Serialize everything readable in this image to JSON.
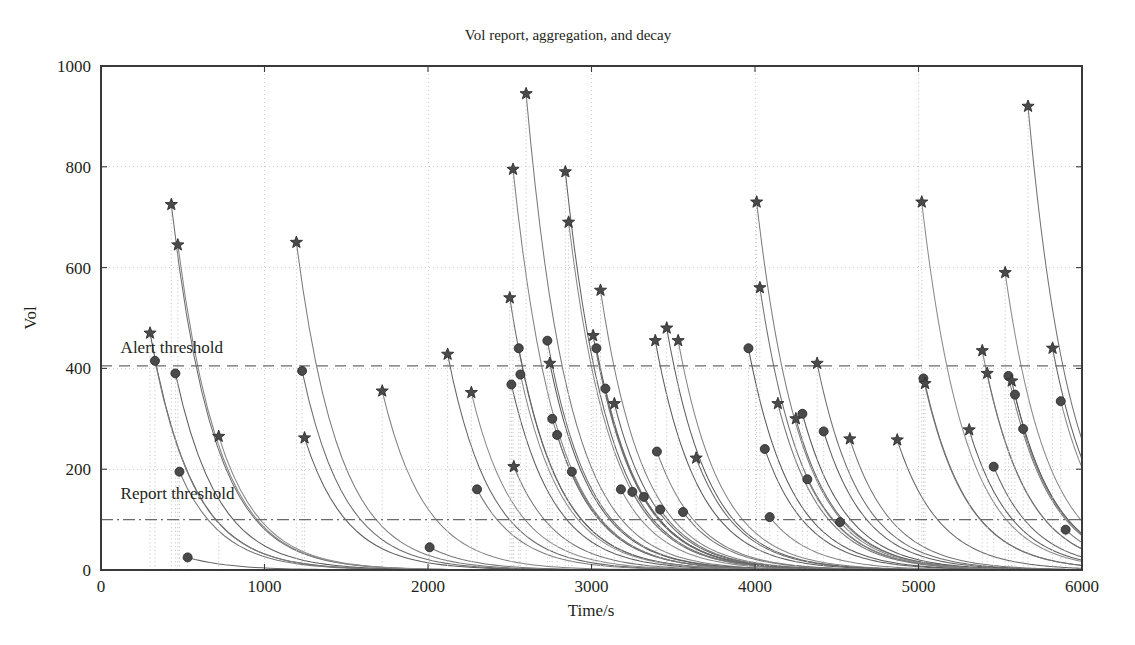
{
  "chart_data": {
    "type": "line",
    "title": "Vol report, aggregation, and decay",
    "xlabel": "Time/s",
    "ylabel": "Vol",
    "xlim": [
      0,
      6000
    ],
    "ylim": [
      0,
      1000
    ],
    "xticks": [
      0,
      1000,
      2000,
      3000,
      4000,
      5000,
      6000
    ],
    "yticks": [
      0,
      200,
      400,
      600,
      800,
      1000
    ],
    "xtick_labels": [
      "0",
      "1000",
      "2000",
      "3000",
      "4000",
      "5000",
      "6000"
    ],
    "ytick_labels": [
      "0",
      "200",
      "400",
      "600",
      "800",
      "1000"
    ],
    "grid": "dotted-light",
    "legend": "none",
    "annotations": [
      {
        "name": "alert-threshold",
        "label": "Alert threshold",
        "value": 405,
        "style": "dashed",
        "label_x": 120,
        "label_y": 430
      },
      {
        "name": "report-threshold",
        "label": "Report threshold",
        "value": 100,
        "style": "dashdot",
        "label_x": 120,
        "label_y": 140
      }
    ],
    "marker_star_label": "Alert event peak",
    "marker_circle_label": "Report event peak",
    "decay_tau": 260,
    "events": [
      {
        "t": 300,
        "peak": 470,
        "marker": "star"
      },
      {
        "t": 330,
        "peak": 415,
        "marker": "circle"
      },
      {
        "t": 430,
        "peak": 725,
        "marker": "star"
      },
      {
        "t": 455,
        "peak": 390,
        "marker": "circle"
      },
      {
        "t": 470,
        "peak": 645,
        "marker": "star"
      },
      {
        "t": 480,
        "peak": 195,
        "marker": "circle"
      },
      {
        "t": 530,
        "peak": 25,
        "marker": "circle"
      },
      {
        "t": 720,
        "peak": 265,
        "marker": "star"
      },
      {
        "t": 1195,
        "peak": 650,
        "marker": "star"
      },
      {
        "t": 1230,
        "peak": 395,
        "marker": "circle"
      },
      {
        "t": 1245,
        "peak": 262,
        "marker": "star"
      },
      {
        "t": 1720,
        "peak": 355,
        "marker": "star"
      },
      {
        "t": 2010,
        "peak": 45,
        "marker": "circle"
      },
      {
        "t": 2120,
        "peak": 428,
        "marker": "star"
      },
      {
        "t": 2265,
        "peak": 352,
        "marker": "star"
      },
      {
        "t": 2300,
        "peak": 160,
        "marker": "circle"
      },
      {
        "t": 2500,
        "peak": 540,
        "marker": "star"
      },
      {
        "t": 2510,
        "peak": 368,
        "marker": "circle"
      },
      {
        "t": 2520,
        "peak": 795,
        "marker": "star"
      },
      {
        "t": 2525,
        "peak": 205,
        "marker": "star"
      },
      {
        "t": 2555,
        "peak": 440,
        "marker": "circle"
      },
      {
        "t": 2565,
        "peak": 388,
        "marker": "circle"
      },
      {
        "t": 2600,
        "peak": 945,
        "marker": "star"
      },
      {
        "t": 2730,
        "peak": 455,
        "marker": "circle"
      },
      {
        "t": 2745,
        "peak": 410,
        "marker": "star"
      },
      {
        "t": 2760,
        "peak": 300,
        "marker": "circle"
      },
      {
        "t": 2790,
        "peak": 268,
        "marker": "circle"
      },
      {
        "t": 2840,
        "peak": 790,
        "marker": "star"
      },
      {
        "t": 2860,
        "peak": 690,
        "marker": "star"
      },
      {
        "t": 2880,
        "peak": 195,
        "marker": "circle"
      },
      {
        "t": 3010,
        "peak": 465,
        "marker": "star"
      },
      {
        "t": 3030,
        "peak": 440,
        "marker": "circle"
      },
      {
        "t": 3055,
        "peak": 555,
        "marker": "star"
      },
      {
        "t": 3085,
        "peak": 360,
        "marker": "circle"
      },
      {
        "t": 3140,
        "peak": 330,
        "marker": "star"
      },
      {
        "t": 3180,
        "peak": 160,
        "marker": "circle"
      },
      {
        "t": 3250,
        "peak": 155,
        "marker": "circle"
      },
      {
        "t": 3320,
        "peak": 145,
        "marker": "circle"
      },
      {
        "t": 3390,
        "peak": 455,
        "marker": "star"
      },
      {
        "t": 3400,
        "peak": 235,
        "marker": "circle"
      },
      {
        "t": 3420,
        "peak": 120,
        "marker": "circle"
      },
      {
        "t": 3460,
        "peak": 480,
        "marker": "star"
      },
      {
        "t": 3530,
        "peak": 455,
        "marker": "star"
      },
      {
        "t": 3560,
        "peak": 115,
        "marker": "circle"
      },
      {
        "t": 3640,
        "peak": 222,
        "marker": "star"
      },
      {
        "t": 3960,
        "peak": 440,
        "marker": "circle"
      },
      {
        "t": 4010,
        "peak": 730,
        "marker": "star"
      },
      {
        "t": 4030,
        "peak": 560,
        "marker": "star"
      },
      {
        "t": 4060,
        "peak": 240,
        "marker": "circle"
      },
      {
        "t": 4090,
        "peak": 105,
        "marker": "circle"
      },
      {
        "t": 4140,
        "peak": 330,
        "marker": "star"
      },
      {
        "t": 4250,
        "peak": 300,
        "marker": "star"
      },
      {
        "t": 4290,
        "peak": 310,
        "marker": "circle"
      },
      {
        "t": 4320,
        "peak": 180,
        "marker": "circle"
      },
      {
        "t": 4380,
        "peak": 410,
        "marker": "star"
      },
      {
        "t": 4420,
        "peak": 275,
        "marker": "circle"
      },
      {
        "t": 4520,
        "peak": 95,
        "marker": "circle"
      },
      {
        "t": 4580,
        "peak": 260,
        "marker": "star"
      },
      {
        "t": 4870,
        "peak": 258,
        "marker": "star"
      },
      {
        "t": 5020,
        "peak": 730,
        "marker": "star"
      },
      {
        "t": 5030,
        "peak": 380,
        "marker": "circle"
      },
      {
        "t": 5040,
        "peak": 370,
        "marker": "star"
      },
      {
        "t": 5310,
        "peak": 278,
        "marker": "star"
      },
      {
        "t": 5390,
        "peak": 435,
        "marker": "star"
      },
      {
        "t": 5420,
        "peak": 390,
        "marker": "star"
      },
      {
        "t": 5460,
        "peak": 205,
        "marker": "circle"
      },
      {
        "t": 5530,
        "peak": 590,
        "marker": "star"
      },
      {
        "t": 5550,
        "peak": 385,
        "marker": "circle"
      },
      {
        "t": 5570,
        "peak": 375,
        "marker": "star"
      },
      {
        "t": 5590,
        "peak": 348,
        "marker": "circle"
      },
      {
        "t": 5640,
        "peak": 280,
        "marker": "circle"
      },
      {
        "t": 5670,
        "peak": 920,
        "marker": "star"
      },
      {
        "t": 5820,
        "peak": 440,
        "marker": "star"
      },
      {
        "t": 5870,
        "peak": 335,
        "marker": "circle"
      },
      {
        "t": 5900,
        "peak": 80,
        "marker": "circle"
      }
    ]
  },
  "colors": {
    "curve": "#5a5a5a",
    "marker": "#4a4a4a",
    "axis": "#3a3a3a",
    "grid": "#c9c9c9",
    "threshold": "#6a6a6a",
    "background": "#ffffff",
    "text": "#231f20"
  },
  "plot_box": {
    "left": 101,
    "top": 66,
    "right": 1082,
    "bottom": 570
  }
}
